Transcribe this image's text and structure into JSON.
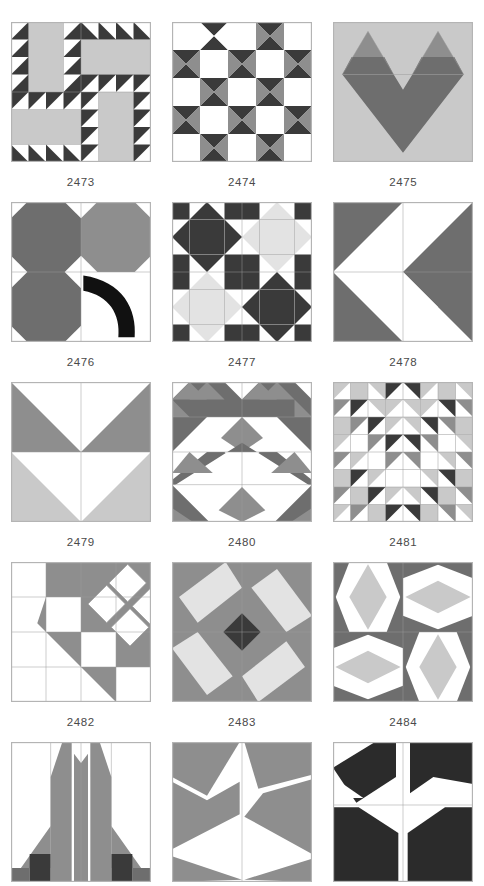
{
  "page": {
    "kind": "quilt-block-catalog-page",
    "columns": 3,
    "visible_rows": 5,
    "last_row_clipped": true
  },
  "palette": {
    "white": "#ffffff",
    "light_gray": "#c9c9c9",
    "pale_gray": "#e3e3e3",
    "medium_gray": "#8e8e8e",
    "dark_gray": "#6e6e6e",
    "charcoal": "#3a3a3a",
    "black": "#111111",
    "frame": "#b4b4b4",
    "seam": "#9a9a9a",
    "caption_color": "#4a4a4a",
    "background": "#ffffff"
  },
  "blocks": [
    {
      "id": "2473",
      "label": "2473",
      "name": "sawtooth-corner-pinwheel",
      "description": "Four rotating L-shaped units, each a plain light bar edged with dark sawtooth triangles",
      "ground": "#ffffff",
      "accents": [
        "#c9c9c9",
        "#3a3a3a"
      ]
    },
    {
      "id": "2474",
      "label": "2474",
      "name": "hourglass-checkerboard",
      "description": "Five by five grid alternating white squares with dark and medium hourglass units",
      "ground": "#ffffff",
      "accents": [
        "#3a3a3a",
        "#8e8e8e"
      ]
    },
    {
      "id": "2475",
      "label": "2475",
      "name": "heart",
      "description": "Large dark heart formed from a square on point plus two lobes on a light gray ground",
      "ground": "#c9c9c9",
      "accents": [
        "#6e6e6e",
        "#8e8e8e"
      ]
    },
    {
      "id": "2476",
      "label": "2476",
      "name": "three-leaf-clover-with-stem",
      "description": "Three gray octagon snowball units forming a clover with a black curved stem",
      "ground": "#ffffff",
      "accents": [
        "#6e6e6e",
        "#8e8e8e",
        "#111111"
      ]
    },
    {
      "id": "2477",
      "label": "2477",
      "name": "four-variable-stars",
      "description": "Two by two set of eight point stars alternating dark on light and light on dark",
      "ground": "#ffffff",
      "accents": [
        "#3a3a3a",
        "#e3e3e3"
      ]
    },
    {
      "id": "2478",
      "label": "2478",
      "name": "double-arrow-left",
      "description": "Two left pointing chevron arrows, dark field with white triangles",
      "ground": "#ffffff",
      "accents": [
        "#6e6e6e"
      ]
    },
    {
      "id": "2479",
      "label": "2479",
      "name": "double-chevron-down",
      "description": "Two stacked downward chevrons, dark gray above light gray",
      "ground": "#ffffff",
      "accents": [
        "#8e8e8e",
        "#c9c9c9"
      ]
    },
    {
      "id": "2480",
      "label": "2480",
      "name": "peaked-mountain-rows",
      "description": "Banded rows of large dark peaks with medium gray diamonds and white valleys",
      "ground": "#ffffff",
      "accents": [
        "#6e6e6e",
        "#8e8e8e",
        "#c9c9c9"
      ]
    },
    {
      "id": "2481",
      "label": "2481",
      "name": "nested-chevron-mosaic",
      "description": "Eight by eight half square triangle grid forming nested V chevrons",
      "ground": "#ffffff",
      "accents": [
        "#3a3a3a",
        "#8e8e8e",
        "#c9c9c9"
      ]
    },
    {
      "id": "2482",
      "label": "2482",
      "name": "diagonal-staircase-with-diamonds",
      "description": "Gray field split by a diagonal stair of white squares with four white diamonds at the corner",
      "ground": "#8e8e8e",
      "accents": [
        "#ffffff"
      ]
    },
    {
      "id": "2483",
      "label": "2483",
      "name": "pinwheel-star-dark-center",
      "description": "Four light gray pinwheel blades on gray with a dark square on point at the center",
      "ground": "#8e8e8e",
      "accents": [
        "#e3e3e3",
        "#3a3a3a"
      ]
    },
    {
      "id": "2484",
      "label": "2484",
      "name": "four-diamond-quadrants",
      "description": "Four quadrants each holding a light gray diamond framed by dark corner triangles",
      "ground": "#ffffff",
      "accents": [
        "#6e6e6e",
        "#c9c9c9"
      ]
    },
    {
      "id": "row5-a",
      "label": "",
      "name": "tulip-fan-clipped",
      "description": "Partially visible block, gray fan blades rising from dark base",
      "ground": "#ffffff",
      "accents": [
        "#8e8e8e",
        "#3a3a3a"
      ]
    },
    {
      "id": "row5-b",
      "label": "",
      "name": "pinwheel-blades-clipped",
      "description": "Partially visible block, broad gray blades spinning around center",
      "ground": "#ffffff",
      "accents": [
        "#8e8e8e"
      ]
    },
    {
      "id": "row5-c",
      "label": "",
      "name": "dark-ribbon-clipped",
      "description": "Partially visible block, bold dark ribbon shapes on white",
      "ground": "#ffffff",
      "accents": [
        "#2b2b2b"
      ]
    }
  ]
}
